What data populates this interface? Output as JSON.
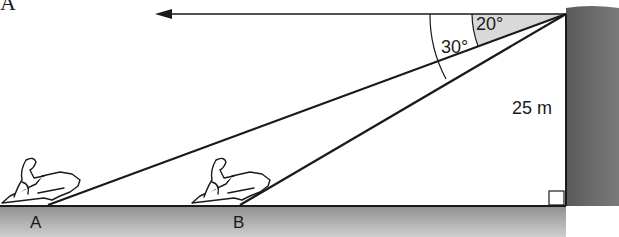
{
  "diagram": {
    "corner_label": "A",
    "angle_small": "20°",
    "angle_large": "30°",
    "cliff_height": "25 m",
    "point_a": "A",
    "point_b": "B",
    "elements": {
      "horizontal_arrow": "leftward arrow from clifftop",
      "cliff": "vertical cliff edge",
      "ground": "sea level line",
      "boats": [
        "jet-ski at A",
        "jet-ski at B"
      ],
      "right_angle_marker": "at cliff base"
    },
    "colors": {
      "line": "#1a1a1a",
      "cliff_fill": "#6e6e6e",
      "ground_fill": "#b5b5b5",
      "angle_shade": "#d9d9d9"
    }
  }
}
